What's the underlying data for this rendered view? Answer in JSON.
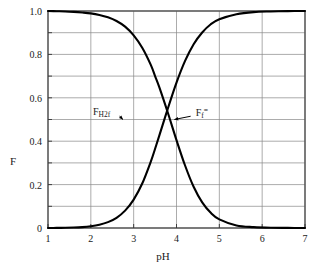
{
  "chart_data": {
    "type": "line",
    "title": "",
    "xlabel": "pH",
    "ylabel": "F",
    "xlim": [
      1,
      7
    ],
    "ylim": [
      0,
      1.0
    ],
    "xticks": [
      "1",
      "2",
      "3",
      "4",
      "5",
      "6",
      "7"
    ],
    "yticks": [
      "0",
      "0.2",
      "0.4",
      "0.6",
      "0.8",
      "1.0"
    ],
    "grid": true,
    "grid_x_step": 1,
    "grid_y_step": 0.1,
    "legend_position": "inline-annotations",
    "curve_color": "#000000",
    "grid_color": "#888888",
    "frame_color": "#555555",
    "background": "#ffffff",
    "crossing_point": {
      "pH": 3.5,
      "F": 0.17
    },
    "series": [
      {
        "name": "F_H2f",
        "label_base": "F",
        "label_sub": "H",
        "label_sub2": "2",
        "label_sub3": "f",
        "annotation_x": 2.05,
        "annotation_y": 0.53,
        "arrow_to_x": 2.75,
        "arrow_to_y": 0.5,
        "x": [
          1.0,
          1.2,
          1.4,
          1.6,
          1.8,
          2.0,
          2.2,
          2.4,
          2.6,
          2.8,
          3.0,
          3.2,
          3.4,
          3.5,
          3.6,
          3.8,
          4.0,
          4.2,
          4.4,
          4.6,
          4.8,
          5.0,
          5.4,
          5.8,
          6.2,
          6.6,
          7.0
        ],
        "values": [
          1.0,
          0.999,
          0.998,
          0.996,
          0.993,
          0.989,
          0.982,
          0.971,
          0.954,
          0.928,
          0.888,
          0.831,
          0.752,
          0.7,
          0.648,
          0.53,
          0.405,
          0.288,
          0.19,
          0.118,
          0.07,
          0.04,
          0.012,
          0.004,
          0.001,
          0.0005,
          0.0
        ]
      },
      {
        "name": "F_f2minus",
        "label_base": "F",
        "label_sub": "f",
        "label_sup": "=",
        "annotation_x": 4.45,
        "annotation_y": 0.53,
        "arrow_to_x": 3.95,
        "arrow_to_y": 0.5,
        "x": [
          1.0,
          1.2,
          1.4,
          1.6,
          1.8,
          2.0,
          2.2,
          2.4,
          2.6,
          2.8,
          3.0,
          3.2,
          3.4,
          3.5,
          3.6,
          3.8,
          4.0,
          4.2,
          4.4,
          4.6,
          4.8,
          5.0,
          5.4,
          5.8,
          6.2,
          6.6,
          7.0
        ],
        "values": [
          0.0,
          0.0005,
          0.001,
          0.002,
          0.004,
          0.008,
          0.015,
          0.027,
          0.047,
          0.08,
          0.131,
          0.205,
          0.306,
          0.365,
          0.427,
          0.552,
          0.67,
          0.77,
          0.847,
          0.901,
          0.939,
          0.962,
          0.985,
          0.995,
          0.998,
          0.9995,
          1.0
        ]
      }
    ]
  },
  "annotations": {
    "left_label_text": "F",
    "left_label_sub_h": "H",
    "left_label_sub_2": "2",
    "left_label_sub_f": "f",
    "right_label_text": "F",
    "right_label_sub_f": "f",
    "right_label_sup": "="
  }
}
